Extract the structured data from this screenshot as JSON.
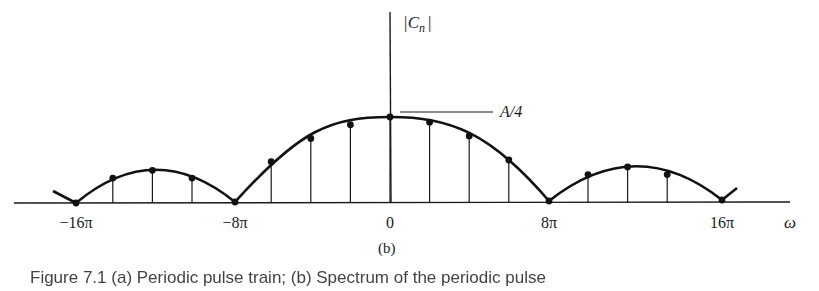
{
  "chart_data": {
    "type": "line",
    "title": "",
    "subplot_label": "(b)",
    "ylabel": "|C_n|",
    "xlabel": "ω",
    "x_ticks": [
      "−16π",
      "−8π",
      "0",
      "8π",
      "16π"
    ],
    "x_tick_values_rad": [
      -50.27,
      -25.13,
      0,
      25.13,
      50.27
    ],
    "annotation": {
      "text": "A/4",
      "points_to": "peak at ω = 0"
    },
    "grid": false,
    "legend": null,
    "units_note": "heights normalized so that peak = A/4 = 1.0",
    "stems": {
      "omega_multiples_of_pi": [
        -14,
        -12,
        -10,
        -6,
        -4,
        -2,
        0,
        2,
        4,
        6,
        10,
        12,
        14
      ],
      "values": [
        0.29,
        0.38,
        0.29,
        0.48,
        0.75,
        0.91,
        1.0,
        0.94,
        0.78,
        0.5,
        0.33,
        0.42,
        0.33
      ]
    },
    "zeros_multiples_of_pi": [
      -16,
      -8,
      8,
      16
    ],
    "xlim_multiples_of_pi": [
      -20,
      20
    ],
    "ylim": [
      0,
      1.1
    ]
  },
  "figure": {
    "y_axis_label_text": "|C",
    "y_axis_label_sub": "n",
    "y_axis_label_close": "|",
    "annotation_label": "A/4",
    "x_axis_symbol": "ω",
    "tick_labels": [
      "−16π",
      "−8π",
      "0",
      "8π",
      "16π"
    ],
    "panel_label": "(b)",
    "caption": "Figure 7.1  (a) Periodic pulse train; (b) Spectrum of the periodic pulse"
  }
}
